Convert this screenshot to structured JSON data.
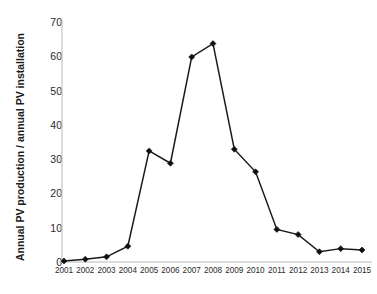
{
  "chart_data": {
    "type": "line",
    "title": "",
    "xlabel": "",
    "ylabel": "Annual PV production / annual PV installation",
    "ylabel_line1": "Annual PV production / annual PV",
    "ylabel_line2": "installation",
    "categories": [
      "2001",
      "2002",
      "2003",
      "2004",
      "2005",
      "2006",
      "2007",
      "2008",
      "2009",
      "2010",
      "2011",
      "2012",
      "2013",
      "2014",
      "2015"
    ],
    "x": [
      2001,
      2002,
      2003,
      2004,
      2005,
      2006,
      2007,
      2008,
      2009,
      2010,
      2011,
      2012,
      2013,
      2014,
      2015
    ],
    "values": [
      0.3,
      0.8,
      1.5,
      4.6,
      32.4,
      28.8,
      59.8,
      63.7,
      32.9,
      26.3,
      9.5,
      8.0,
      3.0,
      3.9,
      3.5
    ],
    "ylim": [
      0,
      70
    ],
    "yticks": [
      0,
      10,
      20,
      30,
      40,
      50,
      60,
      70
    ],
    "ytick_labels": [
      "0",
      "10",
      "20",
      "30",
      "40",
      "50",
      "60",
      "70"
    ],
    "grid": false,
    "legend": null,
    "legend_position": "none",
    "series": [
      {
        "name": "Annual PV production / annual PV installation",
        "values": [
          0.3,
          0.8,
          1.5,
          4.6,
          32.4,
          28.8,
          59.8,
          63.7,
          32.9,
          26.3,
          9.5,
          8.0,
          3.0,
          3.9,
          3.5
        ],
        "line_color": "#1a1a1a",
        "marker": "diamond",
        "marker_color": "#111111"
      }
    ],
    "colors": {
      "line": "#1a1a1a",
      "marker": "#111111",
      "axis": "#b9b9b9",
      "tick_text": "#2a2a2a",
      "background": "#ffffff"
    }
  }
}
